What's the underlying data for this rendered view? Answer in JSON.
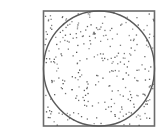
{
  "diagram": {
    "colors": {
      "background": "#ffffff",
      "square_stroke": "#6b6b6b",
      "circle_stroke": "#5a5a5a",
      "point_fill": "#4a4a4a"
    },
    "point_count": 300,
    "seed": 7
  }
}
